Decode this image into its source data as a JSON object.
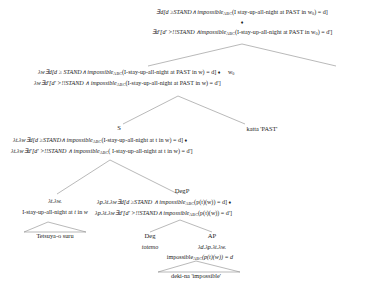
{
  "diagram": {
    "type": "syntax-tree",
    "title_present": false,
    "line_color": "#8a8a8a",
    "text_color": "#1a1a1a",
    "background": "#ffffff"
  },
  "nodes": {
    "root_line1": "∃d[d ≥STAND∧ impossible",
    "root_line1_sub": "ABC",
    "root_line1_tail": "(I stay-up-all-night at PAST in w",
    "root_line1_w_sub": "0",
    "root_line1_end": ") = d]",
    "diamond": "♦",
    "root_line2_a": "∃d'[d' >!!STAND ∧impossible",
    "root_line2_sub": "ABC",
    "root_line2_tail": "(I-stay-up-all-night at PAST in w",
    "root_line2_w_sub": "0",
    "root_line2_end": ") = d']",
    "mid_line1_a": "λw∃d[d ≥ STAND∧ impossible",
    "mid_line1_sub": "ABC",
    "mid_line1_tail": "(I-stay-up-all-night at PAST in w) = d]",
    "mid_line1_diamond": "♦",
    "mid_world_label": "w",
    "mid_world_sub": "0",
    "mid_line2_a": "λw∃d'[d' >!!STAND ∧ impossible",
    "mid_line2_sub": "ABC",
    "mid_line2_tail": "(I-stay-up-all-night at PAST in w) = d']",
    "s_label": "S",
    "katta_label": "katta 'PAST'",
    "s_line1_a": "λt.λw∃d[d ≥STAND∧ impossible",
    "s_line1_sub": "ABC",
    "s_line1_tail": "(I-stay-up-all-night at t in w) = d]",
    "s_line1_diamond": "♦",
    "s_line2_a": "λt.λw∃d'[d' >!!STAND ∧ impossible",
    "s_line2_sub": "ABC",
    "s_line2_tail": "( I-stay-up-all-night at t in w) = d']",
    "vp_line1": "λt.λw.",
    "vp_line2": "I-stay-up-all-night at t in w",
    "tetsuya_leaf": "Tetsuya-o suru",
    "degp_label": "DegP",
    "degp_line1_a": "λp.λt.λw∃d[d ≥STAND ∧ impossible",
    "degp_line1_sub": "ABC",
    "degp_line1_tail": "(p(t)(w)) = d]",
    "degp_line1_diamond": "♦",
    "degp_line2_a": "λp.λt.λw∃d'[d' >!!STAND∧ impossible",
    "degp_line2_sub": "ABC",
    "degp_line2_tail": "(p(t)(w)) = d']",
    "deg_label": "Deg",
    "deg_lex": "totemo",
    "ap_label": "AP",
    "ap_line1": "λd.λp.λt.λw.",
    "ap_line2_a": "impossible",
    "ap_line2_sub": "ABC",
    "ap_line2_tail": "(p(t)(w)) = d",
    "dekina_leaf": "deki-na 'impossible'"
  }
}
